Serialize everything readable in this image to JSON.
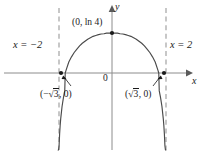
{
  "figure": {
    "kind": "cartesian-plot",
    "background": "#ffffff",
    "ink_color": "#4a4a4a",
    "text_color": "#1a1a1a",
    "axis_color": "#8c8c8c",
    "asymptote_color": "#9a9a9a"
  },
  "axes": {
    "x_label": "x",
    "y_label": "y",
    "origin_label": "0",
    "origin_px": {
      "x": 112,
      "y": 73
    },
    "x_range_px": {
      "left": 4,
      "right": 190
    },
    "y_top_px": 10,
    "y_bottom_px": 150,
    "px_per_unit_x": 27,
    "grid": false
  },
  "asymptotes": [
    {
      "name": "left-vertical-asymptote",
      "label": "x = −2",
      "x_value": -2,
      "x_px": 59,
      "style": "dashed"
    },
    {
      "name": "right-vertical-asymptote",
      "label": "x = 2",
      "x_value": 2,
      "x_px": 166,
      "style": "dashed"
    }
  ],
  "points": [
    {
      "name": "vertex",
      "label": "(0, ln 4)",
      "x_px": 112,
      "y_px": 33,
      "marker": "filled-dot"
    },
    {
      "name": "root-left",
      "label": "(−√3, 0)",
      "x_px": 61,
      "y_px": 73,
      "marker": "filled-dot"
    },
    {
      "name": "root-right",
      "label": "(√3, 0)",
      "x_px": 164,
      "y_px": 73,
      "marker": "filled-dot"
    }
  ],
  "labels": {
    "asym_left": "x = −2",
    "asym_right": "x = 2",
    "vertex": "(0, ln 4)",
    "origin": "0",
    "x_axis": "x",
    "y_axis": "y",
    "root_left_open": "(−",
    "root_left_radicand": "3",
    "root_left_close": ", 0)",
    "root_right_open": "(",
    "root_right_radicand": "3",
    "root_right_close": ", 0)"
  },
  "chart_data": {
    "type": "line",
    "title": "",
    "xlabel": "x",
    "ylabel": "y",
    "function": "y = ln(4 - x^2)",
    "xlim": [
      -2,
      2
    ],
    "ylim": [
      -4.5,
      1.6
    ],
    "grid": false,
    "legend": null,
    "vertical_asymptotes": [
      -2,
      2
    ],
    "x_intercepts": [
      -1.7320508,
      1.7320508
    ],
    "y_intercept": 1.3862944,
    "annotations": [
      {
        "text": "x = −2",
        "x": -2,
        "y": 0.95
      },
      {
        "text": "x = 2",
        "x": 2,
        "y": 0.95
      },
      {
        "text": "(0, ln 4)",
        "x": 0,
        "y": 1.5
      },
      {
        "text": "(−√3, 0)",
        "x": -1.73,
        "y": -0.55
      },
      {
        "text": "(√3, 0)",
        "x": 1.73,
        "y": -0.55
      },
      {
        "text": "0",
        "x": 0.08,
        "y": -0.12
      }
    ],
    "x": [
      -1.995,
      -1.99,
      -1.98,
      -1.96,
      -1.94,
      -1.92,
      -1.9,
      -1.85,
      -1.8,
      -1.75,
      -1.7320508,
      -1.7,
      -1.6,
      -1.5,
      -1.4,
      -1.3,
      -1.2,
      -1.1,
      -1.0,
      -0.9,
      -0.8,
      -0.7,
      -0.6,
      -0.5,
      -0.4,
      -0.3,
      -0.2,
      -0.1,
      0.0,
      0.1,
      0.2,
      0.3,
      0.4,
      0.5,
      0.6,
      0.7,
      0.8,
      0.9,
      1.0,
      1.1,
      1.2,
      1.3,
      1.4,
      1.5,
      1.6,
      1.7,
      1.7320508,
      1.75,
      1.8,
      1.85,
      1.9,
      1.92,
      1.94,
      1.96,
      1.98,
      1.99,
      1.995
    ],
    "y": [
      -4.61,
      -3.92,
      -3.22,
      -2.52,
      -2.11,
      -1.82,
      -1.59,
      -1.16,
      -0.86,
      -0.62,
      -0.0,
      0.1,
      0.38,
      0.56,
      0.71,
      0.83,
      0.94,
      1.03,
      1.1,
      1.17,
      1.22,
      1.27,
      1.3,
      1.33,
      1.35,
      1.36,
      1.38,
      1.38,
      1.386,
      1.38,
      1.38,
      1.36,
      1.35,
      1.33,
      1.3,
      1.27,
      1.22,
      1.17,
      1.1,
      1.03,
      0.94,
      0.83,
      0.71,
      0.56,
      0.38,
      0.1,
      0.0,
      -0.62,
      -0.86,
      -1.16,
      -1.59,
      -1.82,
      -2.11,
      -2.52,
      -3.22,
      -3.92,
      -4.61
    ]
  }
}
